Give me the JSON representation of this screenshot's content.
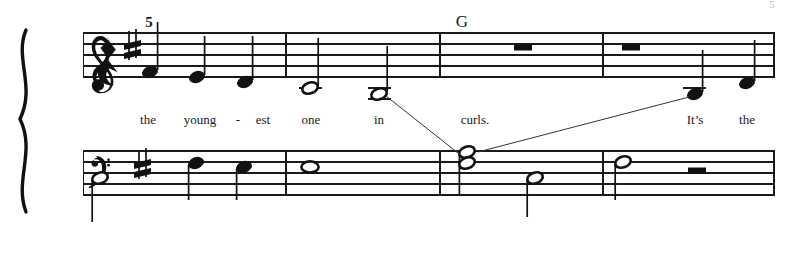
{
  "page": {
    "corner_mark": "5",
    "width": 799,
    "height": 253,
    "background_color": "#ffffff",
    "ink_color": "#111111"
  },
  "system": {
    "brace": "grand-staff-brace",
    "staves": [
      {
        "name": "treble",
        "clef": "treble-clef",
        "key_signature": "one-sharp",
        "top_line_y": 33,
        "line_spacing": 11
      },
      {
        "name": "bass",
        "clef": "bass-clef",
        "key_signature": "one-sharp",
        "top_line_y": 151,
        "line_spacing": 11
      }
    ],
    "measure_number": "5",
    "chord_symbols": [
      {
        "label": "G",
        "x": 462
      }
    ],
    "barlines": [
      {
        "name": "system-start-barline",
        "x": 83
      },
      {
        "name": "barline-1",
        "x": 286
      },
      {
        "name": "barline-2",
        "x": 440
      },
      {
        "name": "barline-3",
        "x": 603
      },
      {
        "name": "final-barline",
        "x": 775
      }
    ]
  },
  "lyrics": [
    {
      "text": "the",
      "x": 148
    },
    {
      "text": "young",
      "x": 199
    },
    {
      "text": "-",
      "x": 237
    },
    {
      "text": "est",
      "x": 262
    },
    {
      "text": "one",
      "x": 310
    },
    {
      "text": "in",
      "x": 379
    },
    {
      "text": "curls.",
      "x": 474
    },
    {
      "text": "It’s",
      "x": 694
    },
    {
      "text": "the",
      "x": 746
    }
  ],
  "treble_notes": [
    {
      "name": "quarter-rest",
      "type": "rest",
      "duration": "quarter",
      "x": 105,
      "y": 50
    },
    {
      "name": "note-quarter-1",
      "type": "note",
      "duration": "quarter",
      "head": "filled",
      "x": 149,
      "y": 72,
      "stem": "up",
      "stem_top": 22
    },
    {
      "name": "note-quarter-2",
      "type": "note",
      "duration": "quarter",
      "head": "filled",
      "x": 196,
      "y": 77,
      "stem": "up",
      "stem_top": 36
    },
    {
      "name": "note-quarter-3",
      "type": "note",
      "duration": "quarter",
      "head": "filled",
      "x": 244,
      "y": 82,
      "stem": "up",
      "stem_top": 36
    },
    {
      "name": "note-half-1",
      "type": "note",
      "duration": "half",
      "head": "open",
      "x": 310,
      "y": 88,
      "stem": "up",
      "stem_top": 38,
      "ledger": 1
    },
    {
      "name": "note-half-2",
      "type": "note",
      "duration": "half",
      "head": "open",
      "x": 379,
      "y": 94,
      "stem": "up",
      "stem_top": 46,
      "ledger": 2
    },
    {
      "name": "whole-rest-1",
      "type": "rest",
      "duration": "whole",
      "x": 523,
      "y": 44
    },
    {
      "name": "whole-rest-2",
      "type": "rest",
      "duration": "whole",
      "x": 631,
      "y": 44
    },
    {
      "name": "note-quarter-4",
      "type": "note",
      "duration": "quarter",
      "head": "filled",
      "x": 694,
      "y": 94,
      "stem": "up",
      "stem_top": 50,
      "ledger": 2
    },
    {
      "name": "note-quarter-5",
      "type": "note",
      "duration": "quarter",
      "head": "filled",
      "x": 746,
      "y": 83,
      "stem": "up",
      "stem_top": 40
    }
  ],
  "bass_notes": [
    {
      "name": "bass-note-half-1",
      "type": "note",
      "duration": "half",
      "head": "open",
      "x": 100,
      "y": 178,
      "stem": "down",
      "stem_bottom": 222
    },
    {
      "name": "bass-note-quarter-1",
      "type": "note",
      "duration": "quarter",
      "head": "filled",
      "x": 196,
      "y": 163,
      "stem": "down",
      "stem_bottom": 200
    },
    {
      "name": "bass-note-quarter-2",
      "type": "note",
      "duration": "quarter",
      "head": "filled",
      "x": 244,
      "y": 167,
      "stem": "down",
      "stem_bottom": 200
    },
    {
      "name": "bass-note-whole-1",
      "type": "note",
      "duration": "whole",
      "head": "whole",
      "x": 310,
      "y": 167
    },
    {
      "name": "bass-dyad-half",
      "type": "dyad",
      "duration": "half",
      "head": "open",
      "x": 467,
      "y_upper": 152,
      "y_lower": 163,
      "stem": "down",
      "stem_bottom": 196
    },
    {
      "name": "bass-note-half-2",
      "type": "note",
      "duration": "half",
      "head": "open",
      "x": 535,
      "y": 178,
      "stem": "down",
      "stem_bottom": 217
    },
    {
      "name": "bass-note-half-3",
      "type": "note",
      "duration": "half",
      "head": "open",
      "x": 623,
      "y": 162,
      "stem": "down",
      "stem_bottom": 200
    },
    {
      "name": "bass-half-rest",
      "type": "rest",
      "duration": "half",
      "x": 697,
      "y": 173
    }
  ],
  "leader_lines": [
    {
      "name": "leader-line-in-to-bass",
      "x1": 386,
      "y1": 96,
      "x2": 462,
      "y2": 156
    },
    {
      "name": "leader-line-bass-to-its",
      "x1": 477,
      "y1": 153,
      "x2": 688,
      "y2": 97
    }
  ]
}
